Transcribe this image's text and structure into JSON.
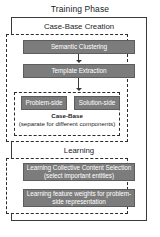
{
  "diagram": {
    "title": "Training Phase",
    "sections": [
      {
        "id": "case-base-creation",
        "title": "Case-Base Creation",
        "steps": [
          {
            "id": "semantic-clustering",
            "label": "Semantic Clustering"
          },
          {
            "id": "template-extraction",
            "label": "Template Extraction"
          }
        ],
        "case_base": {
          "boxes": [
            {
              "id": "problem-side",
              "label": "Problem-side"
            },
            {
              "id": "solution-side",
              "label": "Solution-side"
            }
          ],
          "caption_line1": "Case-Base",
          "caption_line2": "(separate for different components)"
        }
      },
      {
        "id": "learning",
        "title": "Learning",
        "steps": [
          {
            "id": "learning-collective-content-selection",
            "label": "Learning Collective Content Selection (select important entities)"
          },
          {
            "id": "learning-feature-weights",
            "label": "Learning feature weights for problem-side representation"
          }
        ]
      }
    ],
    "colors": {
      "process_box_fill": "#7c7c7c",
      "process_box_text": "#ffffff",
      "border": "#3a3a3a",
      "background": "#ffffff"
    }
  }
}
